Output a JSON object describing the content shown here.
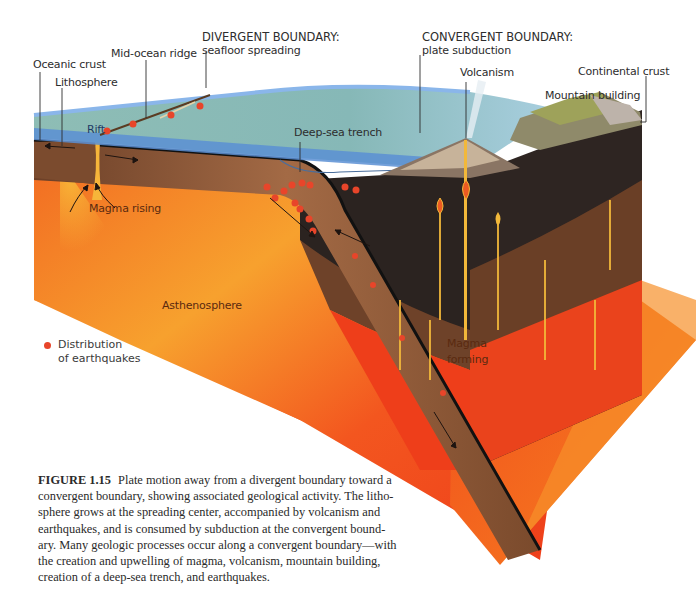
{
  "figure": {
    "labels": {
      "divergent_boundary_title": "DIVERGENT BOUNDARY:",
      "divergent_boundary_sub": "seafloor spreading",
      "convergent_boundary_title": "CONVERGENT BOUNDARY:",
      "convergent_boundary_sub": "plate subduction",
      "mid_ocean_ridge": "Mid-ocean ridge",
      "oceanic_crust": "Oceanic crust",
      "lithosphere": "Lithosphere",
      "rift": "Rift",
      "deep_sea_trench": "Deep-sea trench",
      "volcanism": "Volcanism",
      "continental_crust": "Continental crust",
      "mountain_building": "Mountain building",
      "magma_rising": "Magma rising",
      "asthenosphere": "Asthenosphere",
      "magma_forming_1": "Magma",
      "magma_forming_2": "forming"
    },
    "legend": {
      "line1": "Distribution",
      "line2": "of earthquakes",
      "marker_color": "#e8452a"
    },
    "colors": {
      "ocean_surface": "#7fb3b0",
      "ocean_edge": "#6d9fd8",
      "lithosphere": "#8a5a3a",
      "asthenosphere_hot": "#f0401c",
      "asthenosphere_warm": "#f7a52a",
      "continental": "#2e2522",
      "earthquake": "#e8452a"
    }
  },
  "caption": {
    "figure_number": "FIGURE 1.15",
    "lines": [
      "Plate motion away from a divergent boundary toward a",
      "convergent boundary, showing associated geological activity. The litho-",
      "sphere grows at the spreading center, accompanied by volcanism and",
      "earthquakes, and is consumed by subduction at the convergent bound-",
      "ary. Many geologic processes occur along a convergent boundary—with",
      "the creation and upwelling of magma, volcanism, mountain building,",
      "creation of a deep-sea trench, and earthquakes."
    ]
  }
}
